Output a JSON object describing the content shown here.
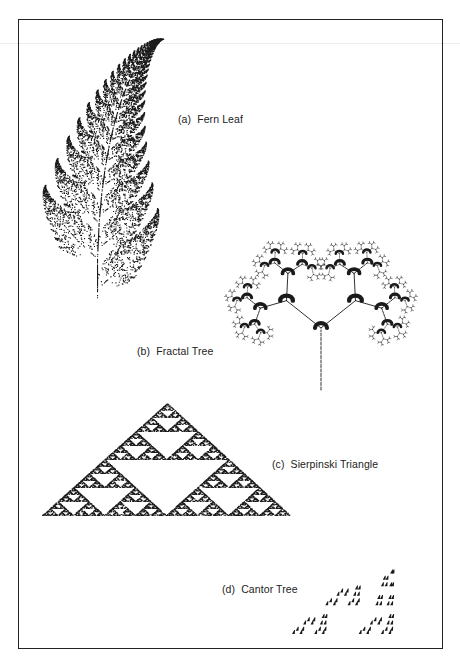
{
  "figure": {
    "panels": [
      {
        "id": "a",
        "tag": "(a)",
        "title": "Fern Leaf"
      },
      {
        "id": "b",
        "tag": "(b)",
        "title": "Fractal Tree"
      },
      {
        "id": "c",
        "tag": "(c)",
        "title": "Sierpinski Triangle"
      },
      {
        "id": "d",
        "tag": "(d)",
        "title": "Cantor Tree"
      }
    ],
    "colors": {
      "ink": "#1a1a1a",
      "frame": "#222222",
      "background": "#ffffff"
    }
  }
}
